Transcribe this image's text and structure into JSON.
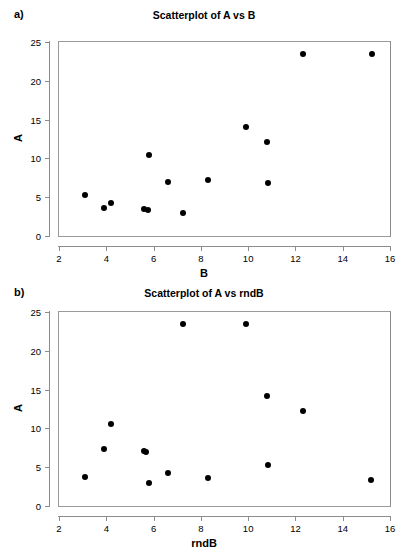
{
  "figure": {
    "panels": [
      {
        "letter": "a)",
        "title": "Scatterplot of A vs B",
        "chart_data": {
          "type": "scatter",
          "title": "Scatterplot of A vs B",
          "xlabel": "B",
          "ylabel": "A",
          "xlim": [
            2,
            16
          ],
          "ylim": [
            0,
            25
          ],
          "xticks": [
            "2",
            "4",
            "6",
            "8",
            "10",
            "12",
            "14",
            "16"
          ],
          "yticks": [
            "0",
            "5",
            "10",
            "15",
            "20",
            "25"
          ],
          "grid": false,
          "legend": "none",
          "marker": "filled-circle",
          "marker_color": "#000000",
          "x": [
            3.1,
            3.9,
            4.2,
            5.6,
            5.75,
            5.8,
            6.6,
            7.25,
            8.3,
            9.9,
            10.8,
            10.85,
            12.3,
            15.25
          ],
          "y": [
            5.3,
            3.6,
            4.2,
            3.5,
            3.4,
            10.4,
            7.0,
            2.9,
            7.2,
            14.1,
            12.1,
            6.8,
            23.5,
            23.4
          ]
        }
      },
      {
        "letter": "b)",
        "title": "Scatterplot of A vs rndB",
        "chart_data": {
          "type": "scatter",
          "title": "Scatterplot of A vs rndB",
          "xlabel": "rndB",
          "ylabel": "A",
          "xlim": [
            2,
            16
          ],
          "ylim": [
            0,
            25
          ],
          "xticks": [
            "2",
            "4",
            "6",
            "8",
            "10",
            "12",
            "14",
            "16"
          ],
          "yticks": [
            "0",
            "5",
            "10",
            "15",
            "20",
            "25"
          ],
          "grid": false,
          "legend": "none",
          "marker": "filled-circle",
          "marker_color": "#000000",
          "x": [
            3.1,
            3.9,
            4.2,
            5.6,
            5.7,
            5.8,
            6.6,
            7.25,
            8.3,
            9.9,
            10.8,
            10.85,
            12.3,
            15.2
          ],
          "y": [
            3.8,
            7.3,
            10.6,
            7.1,
            7.0,
            3.0,
            4.3,
            23.5,
            3.6,
            23.4,
            14.2,
            5.3,
            12.3,
            3.4
          ]
        }
      }
    ]
  }
}
